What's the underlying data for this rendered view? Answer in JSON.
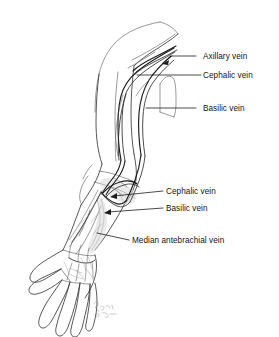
{
  "figure": {
    "background_color": "#ffffff",
    "ink_color": "#1c1c1c",
    "vein_shade_color": "#d8d8d8"
  },
  "labels": [
    {
      "id": "axillary-vein",
      "text": "Axillary vein",
      "x": 203,
      "y": 52,
      "leader": {
        "x1": 196,
        "y1": 56,
        "x2": 172,
        "y2": 56
      },
      "arrow": {
        "x": 164,
        "y": 63,
        "angle": 218
      }
    },
    {
      "id": "cephalic-vein-upper",
      "text": "Cephalic vein",
      "x": 203,
      "y": 71,
      "leader": {
        "x1": 201,
        "y1": 75,
        "x2": 137,
        "y2": 75
      },
      "arrow": null
    },
    {
      "id": "basilic-vein-upper",
      "text": "Basilic vein",
      "x": 203,
      "y": 104,
      "leader": {
        "x1": 196,
        "y1": 108,
        "x2": 146,
        "y2": 108
      },
      "arrow": null
    },
    {
      "id": "cephalic-vein-lower",
      "text": "Cephalic vein",
      "x": 166,
      "y": 187,
      "leader": {
        "x1": 163,
        "y1": 191,
        "x2": 110,
        "y2": 197
      },
      "arrow": {
        "x": 110,
        "y": 197,
        "angle": 186
      }
    },
    {
      "id": "basilic-vein-lower",
      "text": "Basilic vein",
      "x": 166,
      "y": 204,
      "leader": {
        "x1": 163,
        "y1": 208,
        "x2": 104,
        "y2": 213
      },
      "arrow": {
        "x": 104,
        "y": 213,
        "angle": 185
      }
    },
    {
      "id": "median-antebrachial-vein",
      "text": "Median antebrachial vein",
      "x": 132,
      "y": 236,
      "leader": {
        "x1": 129,
        "y1": 240,
        "x2": 97,
        "y2": 233
      },
      "arrow": null
    }
  ],
  "anatomy": {
    "regions": [
      "shoulder",
      "upper-arm",
      "antecubital-fossa",
      "forearm",
      "wrist",
      "hand-dorsum",
      "digits"
    ],
    "vessels": [
      "axillary vein",
      "cephalic vein",
      "basilic vein",
      "median antebrachial vein",
      "median cubital vein",
      "dorsal venous network"
    ],
    "digit_count": 5
  },
  "signature": {
    "present": true,
    "legible": false,
    "x": 96,
    "y": 308
  }
}
